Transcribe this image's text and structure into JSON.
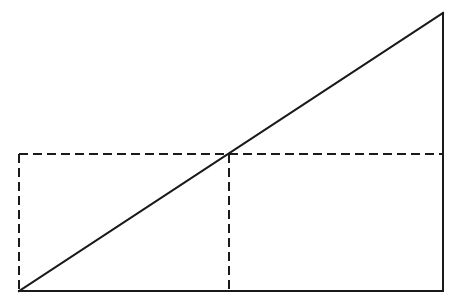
{
  "diagram": {
    "type": "geometric-construction",
    "colors": {
      "background": "#ffffff",
      "stroke": "#1a1a1a"
    },
    "points": {
      "A_bottom_left": [
        19,
        291
      ],
      "B_bottom_right": [
        443,
        291
      ],
      "C_top_right": [
        443,
        13
      ],
      "M_midpoint": [
        229,
        154
      ],
      "D_dashed_top_left": [
        19,
        154
      ],
      "E_dashed_right": [
        443,
        154
      ],
      "F_dashed_foot": [
        229,
        291
      ]
    },
    "solid_lines": [
      {
        "name": "base",
        "from": [
          19,
          291
        ],
        "to": [
          443,
          291
        ]
      },
      {
        "name": "vertical-side",
        "from": [
          443,
          291
        ],
        "to": [
          443,
          13
        ]
      },
      {
        "name": "hypotenuse",
        "from": [
          19,
          291
        ],
        "to": [
          443,
          13
        ]
      }
    ],
    "dashed_lines": [
      {
        "name": "midline-horizontal",
        "from": [
          19,
          154
        ],
        "to": [
          443,
          154
        ]
      },
      {
        "name": "left-vertical",
        "from": [
          19,
          154
        ],
        "to": [
          19,
          291
        ]
      },
      {
        "name": "mid-vertical",
        "from": [
          229,
          154
        ],
        "to": [
          229,
          291
        ]
      }
    ]
  }
}
